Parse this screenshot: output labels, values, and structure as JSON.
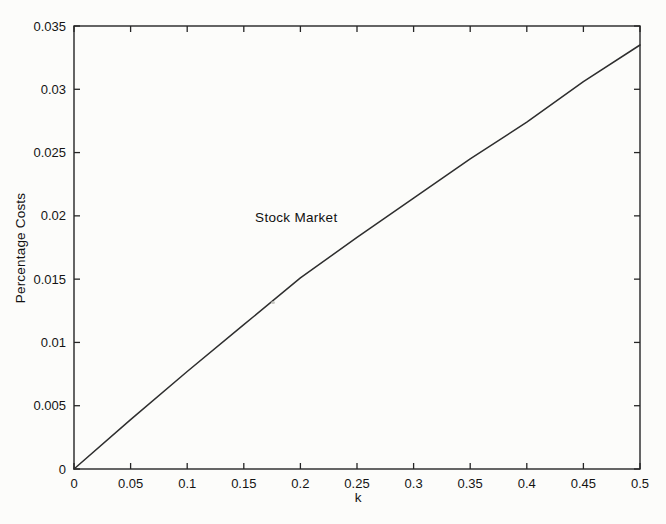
{
  "figure": {
    "background": "#fcfcfa",
    "ink": "#1e1e1e"
  },
  "chart_data": {
    "type": "line",
    "title": "",
    "xlabel": "k",
    "ylabel": "Percentage Costs",
    "xlim": [
      0,
      0.5
    ],
    "ylim": [
      0,
      0.035
    ],
    "xticks": [
      0,
      0.05,
      0.1,
      0.15,
      0.2,
      0.25,
      0.3,
      0.35,
      0.4,
      0.45,
      0.5
    ],
    "xtick_labels": [
      "0",
      "0.05",
      "0.1",
      "0.15",
      "0.2",
      "0.25",
      "0.3",
      "0.35",
      "0.4",
      "0.45",
      "0.5"
    ],
    "yticks": [
      0,
      0.005,
      0.01,
      0.015,
      0.02,
      0.025,
      0.03,
      0.035
    ],
    "ytick_labels": [
      "0",
      "0.005",
      "0.01",
      "0.015",
      "0.02",
      "0.025",
      "0.03",
      "0.035"
    ],
    "grid": false,
    "legend_position": "none",
    "box": true,
    "axis_color": "#262626",
    "tick_label_color": "#141414",
    "series": [
      {
        "name": "Stock Market",
        "color": "#2e2e2e",
        "x": [
          0,
          0.05,
          0.1,
          0.15,
          0.2,
          0.25,
          0.3,
          0.35,
          0.4,
          0.45,
          0.5
        ],
        "y": [
          0,
          0.0039,
          0.0077,
          0.0114,
          0.0151,
          0.0183,
          0.0214,
          0.0245,
          0.0274,
          0.0306,
          0.0335
        ]
      }
    ],
    "annotation": {
      "text": "Stock Market",
      "x": 0.16,
      "y": 0.0199
    }
  }
}
